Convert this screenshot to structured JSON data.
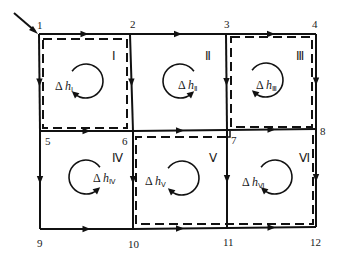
{
  "diagram": {
    "type": "pipe-network-loops",
    "inflow_node": "1",
    "nodes": [
      "1",
      "2",
      "3",
      "4",
      "5",
      "6",
      "7",
      "8",
      "9",
      "10",
      "11",
      "12"
    ],
    "pipes": [
      {
        "from": "1",
        "to": "2",
        "direction": "right"
      },
      {
        "from": "2",
        "to": "3",
        "direction": "right"
      },
      {
        "from": "3",
        "to": "4",
        "direction": "right"
      },
      {
        "from": "1",
        "to": "5",
        "direction": "down"
      },
      {
        "from": "2",
        "to": "6",
        "direction": "down"
      },
      {
        "from": "3",
        "to": "7",
        "direction": "down"
      },
      {
        "from": "4",
        "to": "8",
        "direction": "down"
      },
      {
        "from": "5",
        "to": "6",
        "direction": "right"
      },
      {
        "from": "6",
        "to": "7",
        "direction": "right"
      },
      {
        "from": "7",
        "to": "8",
        "direction": "right"
      },
      {
        "from": "5",
        "to": "9",
        "direction": "down"
      },
      {
        "from": "6",
        "to": "10",
        "direction": "down"
      },
      {
        "from": "7",
        "to": "11",
        "direction": "down"
      },
      {
        "from": "8",
        "to": "12",
        "direction": "down"
      },
      {
        "from": "9",
        "to": "10",
        "direction": "right"
      },
      {
        "from": "10",
        "to": "11",
        "direction": "right"
      },
      {
        "from": "11",
        "to": "12",
        "direction": "right"
      }
    ],
    "loops": [
      {
        "id": "I",
        "dh_base": "Δ h",
        "dh_sub": "I",
        "rotation": "clockwise",
        "dashed": true
      },
      {
        "id": "II",
        "dh_base": "Δ h",
        "dh_sub": "II",
        "rotation": "counterclockwise",
        "dashed": false
      },
      {
        "id": "III",
        "dh_base": "Δ h",
        "dh_sub": "III",
        "rotation": "clockwise",
        "dashed": true
      },
      {
        "id": "IV",
        "dh_base": "Δ h",
        "dh_sub": "IV",
        "rotation": "counterclockwise",
        "dashed": false
      },
      {
        "id": "V",
        "dh_base": "Δ h",
        "dh_sub": "V",
        "rotation": "clockwise",
        "dashed": true
      },
      {
        "id": "VI",
        "dh_base": "Δ h",
        "dh_sub": "VI",
        "rotation": "clockwise",
        "dashed": true
      }
    ],
    "loop_numerals": {
      "I": "Ⅰ",
      "II": "Ⅱ",
      "III": "Ⅲ",
      "IV": "Ⅳ",
      "V": "Ⅴ",
      "VI": "Ⅵ"
    },
    "dashed_circuits": [
      "I",
      "III",
      "V+VI"
    ]
  }
}
